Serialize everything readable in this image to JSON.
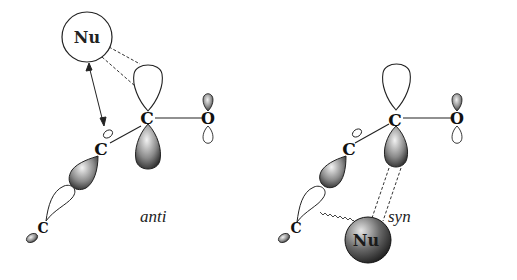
{
  "diagram": {
    "panels": [
      {
        "id": "anti",
        "caption": "anti",
        "nucleophile": {
          "label": "Nu",
          "style": "open-circle"
        },
        "atoms": {
          "carbonyl_carbon": "C",
          "oxygen": "O",
          "alpha_carbon": "C",
          "terminal_carbon": "C"
        }
      },
      {
        "id": "syn",
        "caption": "syn",
        "nucleophile": {
          "label": "Nu",
          "style": "shaded-sphere"
        },
        "atoms": {
          "carbonyl_carbon": "C",
          "oxygen": "O",
          "alpha_carbon": "C",
          "terminal_carbon": "C"
        }
      }
    ],
    "colors": {
      "line": "#222222",
      "shade_dark": "#1a1a1a",
      "shade_light": "#e8e8e8",
      "background": "#ffffff"
    }
  }
}
